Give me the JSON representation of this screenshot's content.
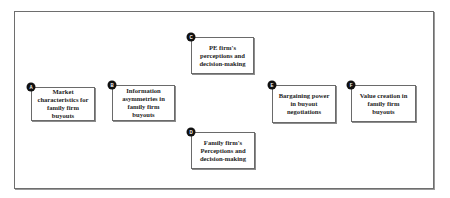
{
  "diagram": {
    "type": "conceptual-framework",
    "nodes": [
      {
        "id": "A",
        "label": "Market characteristics for family firm buyouts",
        "box": {
          "left": 31,
          "top": 87,
          "width": 64,
          "height": 34
        }
      },
      {
        "id": "B",
        "label": "Information asymmetries in family firm buyouts",
        "box": {
          "left": 112,
          "top": 85,
          "width": 63,
          "height": 36
        }
      },
      {
        "id": "C",
        "label": "PE firm's perceptions and decision-making",
        "box": {
          "left": 191,
          "top": 37,
          "width": 63,
          "height": 37
        }
      },
      {
        "id": "D",
        "label": "Family firm's Perceptions and decision-making",
        "box": {
          "left": 191,
          "top": 132,
          "width": 64,
          "height": 37
        }
      },
      {
        "id": "E",
        "label": "Bargaining power in buyout negotiations",
        "box": {
          "left": 272,
          "top": 85,
          "width": 64,
          "height": 38
        }
      },
      {
        "id": "F",
        "label": "Value creation in family firm buyouts",
        "box": {
          "left": 351,
          "top": 85,
          "width": 65,
          "height": 37
        }
      }
    ],
    "colors": {
      "border": "#6a6a6a",
      "badge": "#111111",
      "text": "#1e1e1e",
      "background": "#ffffff"
    }
  }
}
